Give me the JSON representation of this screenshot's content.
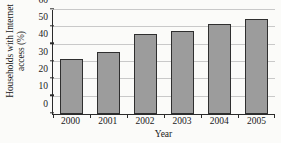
{
  "chart_data": {
    "type": "bar",
    "title": "",
    "categories": [
      "2000",
      "2001",
      "2002",
      "2003",
      "2004",
      "2005"
    ],
    "values": [
      32,
      36,
      46,
      48,
      52,
      55
    ],
    "series": [
      {
        "name": "Households with Internet access (%)",
        "values": [
          32,
          36,
          46,
          48,
          52,
          55
        ]
      }
    ],
    "xlabel": "Year",
    "ylabel_line1": "Households with Internet",
    "ylabel_line2": "access (%)",
    "ylabel": "Households with Internet access (%)",
    "ylim": [
      0,
      60
    ],
    "yticks": [
      "0",
      "10",
      "20",
      "30",
      "40",
      "50",
      "60"
    ],
    "ytick_values": [
      0,
      10,
      20,
      30,
      40,
      50,
      60
    ],
    "grid": true,
    "legend": "none",
    "bar_color": "#9c9c9c",
    "bar_border_color": "#2f2f2f",
    "axis_color": "#2b2b2b",
    "grid_color": "#c9c9c9",
    "background": "#fbfbf9"
  }
}
